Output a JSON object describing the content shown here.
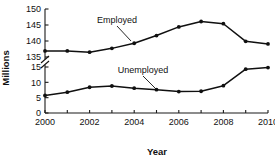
{
  "chart_data": {
    "type": "line",
    "title": "",
    "xlabel": "Year",
    "ylabel": "Millions",
    "x": [
      2000,
      2001,
      2002,
      2003,
      2004,
      2005,
      2006,
      2007,
      2008,
      2009,
      2010
    ],
    "xtick_labels": [
      "2000",
      "2002",
      "2004",
      "2006",
      "2008",
      "2010"
    ],
    "xtick_values": [
      2000,
      2002,
      2004,
      2006,
      2008,
      2010
    ],
    "xminor_tick_values": [
      2001,
      2003,
      2005,
      2007,
      2009
    ],
    "xlim": [
      2000,
      2010
    ],
    "broken_axis": true,
    "axis_break_between": [
      15,
      135
    ],
    "y_lower_segment": {
      "range": [
        0,
        15
      ],
      "ticks": [
        0,
        5,
        10,
        15
      ],
      "tick_labels": [
        "0",
        "5",
        "10",
        "15"
      ]
    },
    "y_upper_segment": {
      "range": [
        135,
        150
      ],
      "ticks": [
        135,
        140,
        145,
        150
      ],
      "tick_labels": [
        "135",
        "140",
        "145",
        "150"
      ]
    },
    "grid": false,
    "legend": "none",
    "series": [
      {
        "name": "Employed",
        "label": "Employed",
        "segment": "upper",
        "color": "#101010",
        "marker": "filled-circle",
        "values": [
          136.9,
          136.9,
          136.5,
          137.7,
          139.3,
          141.7,
          144.4,
          146.1,
          145.4,
          139.9,
          139.1
        ]
      },
      {
        "name": "Unemployed",
        "label": "Unemployed",
        "segment": "lower",
        "color": "#101010",
        "marker": "filled-circle",
        "values": [
          5.7,
          6.8,
          8.4,
          8.8,
          8.1,
          7.6,
          7.0,
          7.1,
          8.9,
          14.3,
          14.8
        ]
      }
    ],
    "annotations": [
      {
        "text": "Employed",
        "points_to_year": 2003,
        "points_to_value": 137.7
      },
      {
        "text": "Unemployed",
        "points_to_year": 2005,
        "points_to_value": 7.6
      }
    ]
  }
}
